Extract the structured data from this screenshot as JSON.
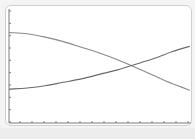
{
  "chart_data": {
    "type": "line",
    "title": "",
    "xlabel": "",
    "ylabel": "",
    "xlim": [
      0,
      10
    ],
    "ylim": [
      0,
      10
    ],
    "grid": false,
    "legend": null,
    "x_tick_count": 15,
    "y_tick_count": 10,
    "x": [
      0,
      1,
      2,
      3,
      4,
      5,
      6,
      7,
      8,
      9,
      10
    ],
    "series": [
      {
        "name": "decreasing-curve",
        "color": "#8a8a8a",
        "values": [
          8.0,
          7.9,
          7.6,
          7.2,
          6.7,
          6.2,
          5.6,
          4.9,
          4.2,
          3.5,
          2.9
        ]
      },
      {
        "name": "increasing-curve",
        "color": "#6a6a6a",
        "values": [
          3.0,
          3.1,
          3.3,
          3.6,
          3.9,
          4.3,
          4.7,
          5.2,
          5.7,
          6.3,
          6.8
        ]
      }
    ],
    "annotations": [
      {
        "type": "intersection",
        "x": 6.7,
        "y": 5.1
      }
    ]
  },
  "style": {
    "frame_border": "#cfcfcf",
    "axis_color": "#7a7a7a",
    "background": "#ffffff"
  }
}
